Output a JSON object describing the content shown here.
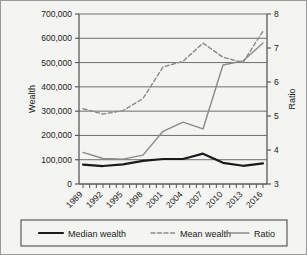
{
  "chart_data": {
    "type": "line",
    "title": "",
    "xlabel": "",
    "ylabel": "Wealth",
    "y2label": "Ratio",
    "grid": true,
    "legend_position": "bottom",
    "x": [
      1989,
      1992,
      1995,
      1998,
      2001,
      2004,
      2007,
      2010,
      2013,
      2016
    ],
    "xtick_labels": [
      "1989",
      "1992",
      "1995",
      "1998",
      "2001",
      "2004",
      "2007",
      "2010",
      "2013",
      "2016"
    ],
    "ylim": [
      0,
      700000
    ],
    "ytick_labels": [
      "0",
      "100,000",
      "200,000",
      "300,000",
      "400,000",
      "500,000",
      "600,000",
      "700,000"
    ],
    "ytick_values": [
      0,
      100000,
      200000,
      300000,
      400000,
      500000,
      600000,
      700000
    ],
    "y2lim": [
      3,
      8
    ],
    "y2tick_labels": [
      "3",
      "4",
      "5",
      "6",
      "7",
      "8"
    ],
    "y2tick_values": [
      3,
      4,
      5,
      6,
      7,
      8
    ],
    "series": [
      {
        "name": "Median wealth",
        "axis": "left",
        "style": "solid",
        "color": "#1a1a1a",
        "width": 2.2,
        "values": [
          80000,
          74000,
          81000,
          95000,
          103000,
          103000,
          125000,
          87000,
          75000,
          85000
        ]
      },
      {
        "name": "Mean wealth",
        "axis": "left",
        "style": "dashed",
        "color": "#8a8a8a",
        "width": 1.4,
        "values": [
          310000,
          288000,
          302000,
          352000,
          482000,
          505000,
          580000,
          522000,
          500000,
          630000
        ]
      },
      {
        "name": "Ratio",
        "axis": "right",
        "style": "solid",
        "color": "#8a8a8a",
        "width": 1.4,
        "values": [
          3.93,
          3.75,
          3.73,
          3.85,
          4.55,
          4.82,
          4.62,
          6.5,
          6.62,
          7.15
        ]
      }
    ]
  },
  "legend": {
    "items": [
      {
        "label": "Median wealth"
      },
      {
        "label": "Mean wealth"
      },
      {
        "label": "Ratio"
      }
    ]
  },
  "colors": {
    "plot_background": "#f4f4f2",
    "grid": "#6e6e6e",
    "axis": "#5a5a5a",
    "border": "#9a9a9a",
    "median": "#1a1a1a",
    "mean": "#8a8a8a",
    "ratio": "#8a8a8a"
  }
}
